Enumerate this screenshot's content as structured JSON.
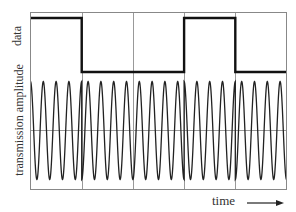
{
  "labels": {
    "data_axis": "data",
    "amplitude_axis": "transmission amplitude",
    "time_axis": "time"
  },
  "chart_data": {
    "type": "line",
    "title": "",
    "xlabel": "time",
    "ylabel_top": "data",
    "ylabel_bottom": "transmission amplitude",
    "grid": {
      "vertical_divisions": 5,
      "bottom_midline": true
    },
    "series": [
      {
        "name": "data",
        "kind": "square",
        "segments": [
          1,
          0,
          0,
          1,
          0
        ]
      },
      {
        "name": "transmission amplitude",
        "kind": "psk_carrier",
        "cycles_per_segment": 4,
        "phase_flip_at_transitions": true
      }
    ],
    "colors": {
      "frame": "#888888",
      "grid": "#999999",
      "data_line": "#111111",
      "carrier_line": "#222222"
    }
  }
}
